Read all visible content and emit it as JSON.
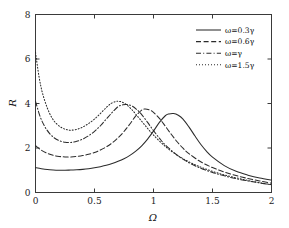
{
  "chart_data": {
    "type": "line",
    "title": "",
    "xlabel": "Ω",
    "ylabel": "R",
    "xlim": [
      0,
      2
    ],
    "ylim": [
      0,
      8
    ],
    "xticks": [
      0,
      0.5,
      1,
      1.5,
      2
    ],
    "xtick_labels": [
      "0",
      "0.5",
      "1",
      "1.5",
      "2"
    ],
    "yticks": [
      0,
      2,
      4,
      6,
      8
    ],
    "ytick_labels": [
      "0",
      "2",
      "4",
      "6",
      "8"
    ],
    "grid": false,
    "legend_position": "top-right",
    "series": [
      {
        "name": "ω=0.3γ",
        "style": "solid",
        "peak": {
          "x": 1.17,
          "y": 3.55
        },
        "x": [
          0.0,
          0.05,
          0.1,
          0.15,
          0.2,
          0.25,
          0.3,
          0.35,
          0.4,
          0.45,
          0.5,
          0.55,
          0.6,
          0.65,
          0.7,
          0.75,
          0.8,
          0.85,
          0.9,
          0.95,
          1.0,
          1.05,
          1.1,
          1.13,
          1.17,
          1.21,
          1.25,
          1.3,
          1.35,
          1.4,
          1.45,
          1.5,
          1.6,
          1.7,
          1.8,
          1.9,
          2.0
        ],
        "y": [
          1.12,
          1.07,
          1.03,
          1.01,
          1.0,
          1.0,
          1.01,
          1.02,
          1.04,
          1.07,
          1.11,
          1.16,
          1.22,
          1.3,
          1.4,
          1.52,
          1.67,
          1.86,
          2.1,
          2.4,
          2.76,
          3.15,
          3.45,
          3.53,
          3.55,
          3.47,
          3.3,
          2.95,
          2.55,
          2.17,
          1.85,
          1.59,
          1.21,
          0.95,
          0.78,
          0.65,
          0.56
        ]
      },
      {
        "name": "ω=0.6γ",
        "style": "dashed",
        "peak": {
          "x": 0.93,
          "y": 3.75
        },
        "x": [
          0.0,
          0.05,
          0.1,
          0.15,
          0.2,
          0.25,
          0.3,
          0.35,
          0.4,
          0.45,
          0.5,
          0.55,
          0.6,
          0.65,
          0.7,
          0.75,
          0.8,
          0.85,
          0.9,
          0.93,
          0.97,
          1.0,
          1.05,
          1.1,
          1.15,
          1.2,
          1.25,
          1.3,
          1.4,
          1.5,
          1.6,
          1.7,
          1.8,
          1.9,
          2.0
        ],
        "y": [
          2.1,
          1.9,
          1.76,
          1.67,
          1.62,
          1.6,
          1.6,
          1.62,
          1.66,
          1.72,
          1.8,
          1.91,
          2.05,
          2.23,
          2.46,
          2.74,
          3.08,
          3.44,
          3.7,
          3.75,
          3.7,
          3.6,
          3.33,
          2.98,
          2.62,
          2.28,
          1.99,
          1.75,
          1.38,
          1.12,
          0.92,
          0.76,
          0.63,
          0.52,
          0.42
        ]
      },
      {
        "name": "ω=γ",
        "style": "dashdot",
        "peak": {
          "x": 0.78,
          "y": 3.95
        },
        "x": [
          0.0,
          0.04,
          0.08,
          0.12,
          0.16,
          0.2,
          0.25,
          0.3,
          0.35,
          0.4,
          0.45,
          0.5,
          0.55,
          0.6,
          0.65,
          0.7,
          0.74,
          0.78,
          0.82,
          0.86,
          0.9,
          0.95,
          1.0,
          1.05,
          1.1,
          1.2,
          1.3,
          1.4,
          1.5,
          1.6,
          1.7,
          1.8,
          1.9,
          2.0
        ],
        "y": [
          4.1,
          3.4,
          2.95,
          2.65,
          2.45,
          2.33,
          2.26,
          2.25,
          2.3,
          2.4,
          2.55,
          2.75,
          3.0,
          3.3,
          3.6,
          3.86,
          3.94,
          3.95,
          3.88,
          3.72,
          3.5,
          3.15,
          2.78,
          2.44,
          2.14,
          1.68,
          1.34,
          1.09,
          0.9,
          0.75,
          0.62,
          0.52,
          0.43,
          0.35
        ]
      },
      {
        "name": "ω=1.5γ",
        "style": "dotted",
        "peak": {
          "x": 0.7,
          "y": 4.1
        },
        "x": [
          0.0,
          0.03,
          0.06,
          0.1,
          0.14,
          0.18,
          0.22,
          0.26,
          0.3,
          0.35,
          0.4,
          0.45,
          0.5,
          0.55,
          0.6,
          0.64,
          0.68,
          0.7,
          0.73,
          0.77,
          0.81,
          0.85,
          0.9,
          0.95,
          1.0,
          1.1,
          1.2,
          1.3,
          1.4,
          1.5,
          1.6,
          1.7,
          1.8,
          1.9,
          2.0
        ],
        "y": [
          6.3,
          5.2,
          4.45,
          3.8,
          3.35,
          3.08,
          2.92,
          2.83,
          2.8,
          2.84,
          2.94,
          3.1,
          3.3,
          3.55,
          3.82,
          4.0,
          4.09,
          4.1,
          4.07,
          3.95,
          3.76,
          3.52,
          3.2,
          2.88,
          2.58,
          2.07,
          1.68,
          1.38,
          1.14,
          0.95,
          0.79,
          0.66,
          0.54,
          0.44,
          0.35
        ]
      }
    ]
  },
  "axes": {
    "x_title": "Ω",
    "y_title": "R"
  },
  "legend": {
    "entries": [
      {
        "label": "ω=0.3γ",
        "style": "solid"
      },
      {
        "label": "ω=0.6γ",
        "style": "dashed"
      },
      {
        "label": "ω=γ",
        "style": "dashdot"
      },
      {
        "label": "ω=1.5γ",
        "style": "dotted"
      }
    ]
  }
}
